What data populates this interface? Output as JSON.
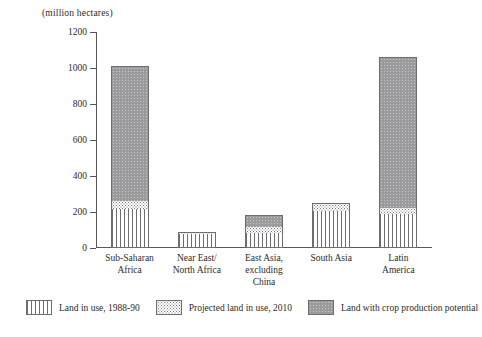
{
  "chart_data": {
    "type": "bar",
    "title": "(million hectares)",
    "xlabel": "",
    "ylabel": "(million hectares)",
    "ylim": [
      0,
      1200
    ],
    "yticks": [
      0,
      200,
      400,
      600,
      800,
      1000,
      1200
    ],
    "grid": false,
    "stacked": true,
    "legend_position": "bottom",
    "categories": [
      "Sub-Saharan Africa",
      "Near East/ North Africa",
      "East Asia, excluding China",
      "South Asia",
      "Latin America"
    ],
    "category_lines": [
      [
        "Sub-Saharan",
        "Africa"
      ],
      [
        "Near East/",
        "North Africa"
      ],
      [
        "East Asia,",
        "excluding",
        "China"
      ],
      [
        "South Asia"
      ],
      [
        "Latin",
        "America"
      ]
    ],
    "series": [
      {
        "name": "Land in use, 1988-90",
        "pattern": "vertical-lines",
        "values": [
          215,
          80,
          85,
          205,
          190
        ]
      },
      {
        "name": "Projected land in use, 2010",
        "pattern": "dots",
        "values": [
          45,
          10,
          30,
          45,
          35
        ]
      },
      {
        "name": "Land with crop production potential",
        "pattern": "grey-fill",
        "values": [
          750,
          0,
          70,
          0,
          835
        ]
      }
    ],
    "totals": [
      1010,
      90,
      185,
      250,
      1060
    ],
    "colors": {
      "axis": "#58585a",
      "outline": "#6e6e70",
      "grey_fill": "#9b9b9d",
      "background": "#ffffff",
      "text": "#2b2b2b"
    }
  }
}
